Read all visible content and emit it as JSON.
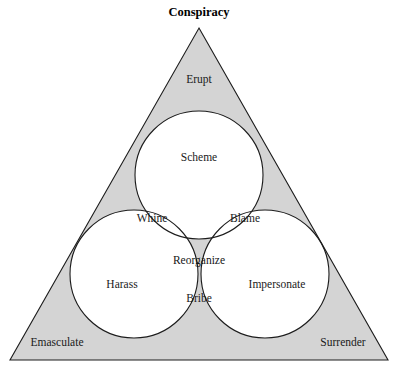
{
  "title": "Conspiracy",
  "colors": {
    "background": "#ffffff",
    "shade": "#d4d4d4",
    "stroke": "#1c1c1c",
    "text": "#1a1a1a"
  },
  "diagram": {
    "type": "venn-in-triangle",
    "shape": "triangle",
    "circle_count": 3,
    "triangle": {
      "apex": [
        199,
        28
      ],
      "bottom_left": [
        10,
        360
      ],
      "bottom_right": [
        388,
        360
      ]
    },
    "circles": [
      {
        "name": "top",
        "cx": 199,
        "cy": 175,
        "r": 64
      },
      {
        "name": "left",
        "cx": 134,
        "cy": 274,
        "r": 64
      },
      {
        "name": "right",
        "cx": 265,
        "cy": 274,
        "r": 64
      }
    ]
  },
  "corners": [
    {
      "id": "corner-top",
      "label": "Erupt",
      "x": 199,
      "y": 80,
      "shaded": true
    },
    {
      "id": "corner-bottom-left",
      "label": "Emasculate",
      "x": 57,
      "y": 343,
      "shaded": true
    },
    {
      "id": "corner-bottom-right",
      "label": "Surrender",
      "x": 343,
      "y": 343,
      "shaded": true
    }
  ],
  "regions": [
    {
      "id": "region-top-circle",
      "label": "Scheme",
      "x": 199,
      "y": 158,
      "shaded": false
    },
    {
      "id": "region-top-left-overlap",
      "label": "Whine",
      "x": 152,
      "y": 219,
      "shaded": false
    },
    {
      "id": "region-top-right-overlap",
      "label": "Blame",
      "x": 245,
      "y": 219,
      "shaded": false
    },
    {
      "id": "region-triple-overlap",
      "label": "Reorganize",
      "x": 199,
      "y": 261,
      "shaded": true
    },
    {
      "id": "region-left-circle",
      "label": "Harass",
      "x": 122,
      "y": 285,
      "shaded": false
    },
    {
      "id": "region-right-circle",
      "label": "Impersonate",
      "x": 277,
      "y": 285,
      "shaded": false
    },
    {
      "id": "region-left-right-overlap",
      "label": "Bribe",
      "x": 199,
      "y": 299,
      "shaded": false
    }
  ]
}
